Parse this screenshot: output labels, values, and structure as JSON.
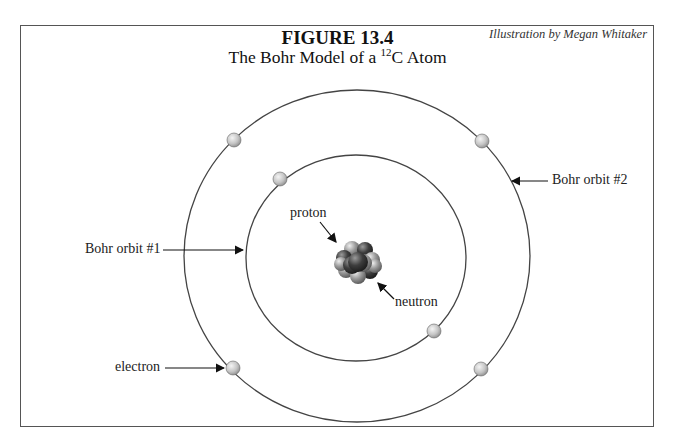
{
  "figure": {
    "number": "FIGURE 13.4",
    "title_prefix": "The Bohr Model of a ",
    "isotope_mass": "12",
    "title_element": "C Atom",
    "credit": "Illustration by Megan Whitaker"
  },
  "labels": {
    "proton": "proton",
    "neutron": "neutron",
    "orbit1": "Bohr orbit #1",
    "orbit2": "Bohr orbit #2",
    "electron": "electron"
  },
  "colors": {
    "line": "#444444",
    "electron": "#c8c8c8",
    "proton": "#3a3a3a",
    "neutron": "#8a8a8a"
  },
  "atom": {
    "inner_orbit_electrons": 2,
    "outer_orbit_electrons": 4
  }
}
